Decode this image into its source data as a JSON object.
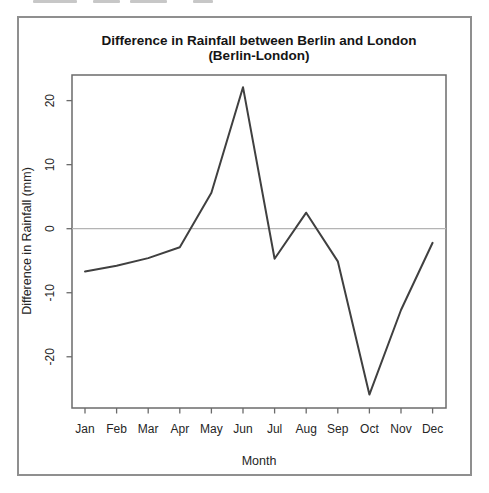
{
  "chart_data": {
    "type": "line",
    "title": "Difference in Rainfall between Berlin and London",
    "subtitle": "(Berlin-London)",
    "xlabel": "Month",
    "ylabel": "Difference in Rainfall (mm)",
    "categories": [
      "Jan",
      "Feb",
      "Mar",
      "Apr",
      "May",
      "Jun",
      "Jul",
      "Aug",
      "Sep",
      "Oct",
      "Nov",
      "Dec"
    ],
    "values": [
      -6.7,
      -5.8,
      -4.6,
      -2.9,
      5.6,
      22.1,
      -4.7,
      2.5,
      -5.1,
      -25.9,
      -12.7,
      -2.2
    ],
    "yticks": [
      -20,
      -10,
      0,
      10,
      20
    ],
    "ylim": [
      -28,
      24
    ],
    "zero_reference": 0,
    "grid": "off",
    "legend": "none",
    "colors": {
      "line": "#404040",
      "zero_line": "#b4b4b4",
      "axis": "#6b6b6b",
      "text": "#262626",
      "frame": "#8f8f8f"
    }
  }
}
